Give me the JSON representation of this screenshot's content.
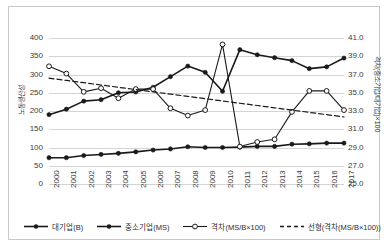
{
  "chart_data": {
    "type": "line",
    "title": "",
    "x": [
      2000,
      2001,
      2002,
      2003,
      2004,
      2005,
      2006,
      2007,
      2008,
      2009,
      2010,
      2011,
      2012,
      2013,
      2014,
      2015,
      2016,
      2017
    ],
    "xlabel": "",
    "ylabel": "노동생산성",
    "y2label": "격차(중소기업/대기업)×100",
    "ylim": [
      0,
      400
    ],
    "y2lim": [
      25.0,
      41.0
    ],
    "yticks": [
      "0",
      "50",
      "100",
      "150",
      "200",
      "250",
      "300",
      "350",
      "400"
    ],
    "y2ticks": [
      "25.0",
      "27.0",
      "29.0",
      "31.0",
      "33.0",
      "35.0",
      "37.0",
      "39.0",
      "41.0"
    ],
    "xticks": [
      "2000",
      "2001",
      "2002",
      "2003",
      "2004",
      "2005",
      "2006",
      "2007",
      "2008",
      "2009",
      "2010",
      "2011",
      "2012",
      "2013",
      "2014",
      "2015",
      "2016",
      "2017"
    ],
    "grid": true,
    "legend_position": "bottom",
    "series": [
      {
        "name": "대기업(B)",
        "axis": "left",
        "marker": "filled-circle",
        "style": "solid",
        "values": [
          190,
          205,
          227,
          231,
          250,
          252,
          265,
          294,
          323,
          306,
          254,
          368,
          354,
          346,
          338,
          316,
          321,
          345
        ]
      },
      {
        "name": "중소기업(MS)",
        "axis": "left",
        "marker": "filled-circle",
        "style": "solid",
        "values": [
          72,
          72,
          78,
          81,
          84,
          88,
          93,
          96,
          102,
          100,
          100,
          101,
          103,
          103,
          109,
          110,
          112,
          112
        ]
      },
      {
        "name": "격차(MS/B×100)",
        "axis": "right",
        "marker": "open-circle",
        "style": "solid",
        "values": [
          37.9,
          37.1,
          35.1,
          35.5,
          34.4,
          35.4,
          35.4,
          33.3,
          32.5,
          33.1,
          40.3,
          29.1,
          29.6,
          29.9,
          32.9,
          35.2,
          35.2,
          33.1
        ]
      },
      {
        "name": "선형(격차(MS/B×100))",
        "axis": "right",
        "marker": "none",
        "style": "dashed",
        "values": [
          36.6,
          36.35,
          36.1,
          35.85,
          35.6,
          35.35,
          35.1,
          34.85,
          34.6,
          34.35,
          34.1,
          33.85,
          33.6,
          33.35,
          33.1,
          32.85,
          32.6,
          32.35
        ]
      }
    ]
  },
  "legend": {
    "items": [
      {
        "label": "대기업(B)"
      },
      {
        "label": "중소기업(MS)"
      },
      {
        "label": "격차(MS/B×100)"
      },
      {
        "label": "선형(격차(MS/B×100))"
      }
    ]
  },
  "colors": {
    "series_line": "#1a1a1a",
    "gridline": "#d4d4d4",
    "frame": "#c9c9c9",
    "text": "#3b3b3b",
    "background": "#ffffff"
  }
}
